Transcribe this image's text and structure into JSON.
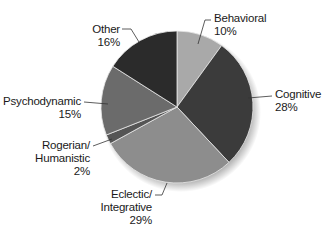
{
  "chart_data": {
    "type": "pie",
    "title": "",
    "start_angle_deg": 0,
    "direction": "clockwise",
    "categories": [
      "Behavioral",
      "Cognitive",
      "Eclectic/ Integrative",
      "Rogerian/ Humanistic",
      "Psychodynamic",
      "Other"
    ],
    "values": [
      10,
      28,
      29,
      2,
      15,
      16
    ],
    "unit": "%",
    "colors": [
      "#a9a9a9",
      "#3b3b3b",
      "#8d8d8d",
      "#555555",
      "#6b6b6b",
      "#2b2b2b"
    ],
    "legend": "none (labels with leader lines)"
  },
  "labels": {
    "behavioral": {
      "name": "Behavioral",
      "pct": "10%"
    },
    "cognitive": {
      "name": "Cognitive",
      "pct": "28%"
    },
    "eclectic": {
      "line1": "Eclectic/",
      "line2": "Integrative",
      "pct": "29%"
    },
    "rogerian": {
      "line1": "Rogerian/",
      "line2": "Humanistic",
      "pct": "2%"
    },
    "psychodynamic": {
      "name": "Psychodynamic",
      "pct": "15%"
    },
    "other": {
      "name": "Other",
      "pct": "16%"
    }
  }
}
